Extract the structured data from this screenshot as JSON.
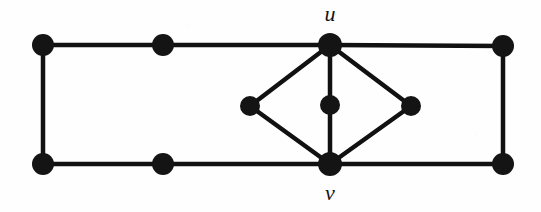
{
  "figure": {
    "kind": "graph-diagram",
    "width": 541,
    "height": 212,
    "background_color": "#fefefe",
    "ink_color": "#111111",
    "node_fill": "#141414",
    "node_radius": 11,
    "small_node_radius": 10,
    "edge_width": 4.5
  },
  "labels": [
    {
      "id": "label-u",
      "text": "u",
      "x": 330,
      "y": 14
    },
    {
      "id": "label-v",
      "text": "v",
      "x": 330,
      "y": 193
    }
  ],
  "nodes": [
    {
      "id": "tl",
      "name": "node-top-left",
      "x": 43,
      "y": 45,
      "r": 11,
      "label": ""
    },
    {
      "id": "tm",
      "name": "node-top-middle",
      "x": 163,
      "y": 45,
      "r": 11,
      "label": ""
    },
    {
      "id": "u",
      "name": "node-u",
      "x": 330,
      "y": 45,
      "r": 12,
      "label": "u"
    },
    {
      "id": "tr",
      "name": "node-top-right",
      "x": 503,
      "y": 46,
      "r": 11,
      "label": ""
    },
    {
      "id": "bl",
      "name": "node-bottom-left",
      "x": 43,
      "y": 164,
      "r": 11,
      "label": ""
    },
    {
      "id": "bm",
      "name": "node-bottom-middle",
      "x": 163,
      "y": 164,
      "r": 11,
      "label": ""
    },
    {
      "id": "v",
      "name": "node-v",
      "x": 330,
      "y": 164,
      "r": 12,
      "label": "v"
    },
    {
      "id": "br",
      "name": "node-bottom-right",
      "x": 503,
      "y": 164,
      "r": 11,
      "label": ""
    },
    {
      "id": "dl",
      "name": "node-diamond-left",
      "x": 250,
      "y": 106,
      "r": 10,
      "label": ""
    },
    {
      "id": "dc",
      "name": "node-diamond-center",
      "x": 330,
      "y": 105,
      "r": 10,
      "label": ""
    },
    {
      "id": "dr",
      "name": "node-diamond-right",
      "x": 411,
      "y": 106,
      "r": 10,
      "label": ""
    }
  ],
  "edges": [
    {
      "id": "e-tl-tm",
      "name": "edge-top-left-to-top-middle",
      "from": "tl",
      "to": "tm"
    },
    {
      "id": "e-tm-u",
      "name": "edge-top-middle-to-u",
      "from": "tm",
      "to": "u"
    },
    {
      "id": "e-u-tr",
      "name": "edge-u-to-top-right",
      "from": "u",
      "to": "tr"
    },
    {
      "id": "e-tl-bl",
      "name": "edge-left-side",
      "from": "tl",
      "to": "bl"
    },
    {
      "id": "e-tr-br",
      "name": "edge-right-side",
      "from": "tr",
      "to": "br"
    },
    {
      "id": "e-bl-bm",
      "name": "edge-bottom-left-to-bottom-middle",
      "from": "bl",
      "to": "bm"
    },
    {
      "id": "e-bm-v",
      "name": "edge-bottom-middle-to-v",
      "from": "bm",
      "to": "v"
    },
    {
      "id": "e-v-br",
      "name": "edge-v-to-bottom-right",
      "from": "v",
      "to": "br"
    },
    {
      "id": "e-u-dl",
      "name": "edge-u-to-diamond-left",
      "from": "u",
      "to": "dl"
    },
    {
      "id": "e-u-dr",
      "name": "edge-u-to-diamond-right",
      "from": "u",
      "to": "dr"
    },
    {
      "id": "e-u-dc",
      "name": "edge-u-to-diamond-center",
      "from": "u",
      "to": "dc"
    },
    {
      "id": "e-dl-v",
      "name": "edge-diamond-left-to-v",
      "from": "dl",
      "to": "v"
    },
    {
      "id": "e-dr-v",
      "name": "edge-diamond-right-to-v",
      "from": "dr",
      "to": "v"
    },
    {
      "id": "e-dc-v",
      "name": "edge-diamond-center-to-v",
      "from": "dc",
      "to": "v"
    }
  ]
}
